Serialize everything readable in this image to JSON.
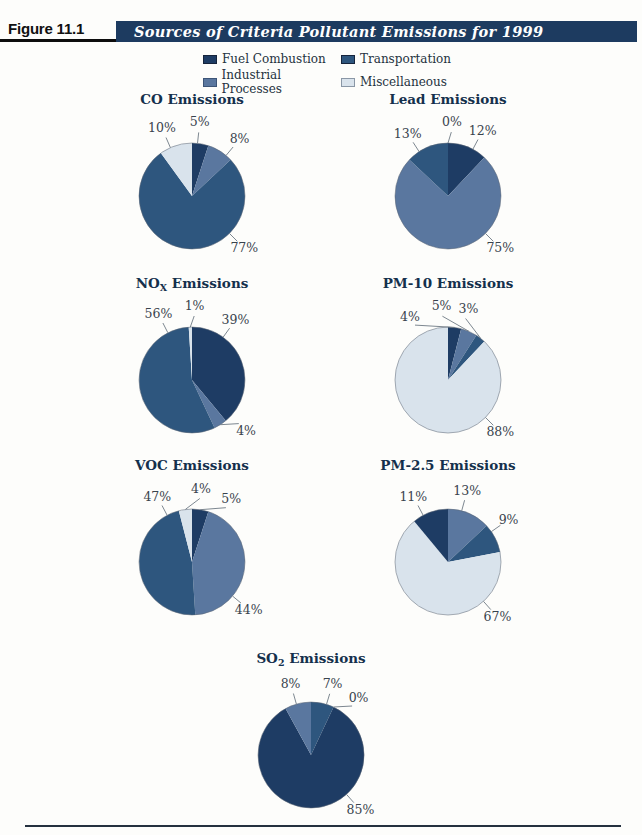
{
  "header": {
    "figure_label": "Figure 11.1",
    "title": "Sources of Criteria Pollutant Emissions for 1999",
    "bar_color": "#1d3b60",
    "text_color": "#ffffff"
  },
  "legend": {
    "items": [
      {
        "label": "Fuel Combustion",
        "color": "#1e3c64",
        "border": "#16243c"
      },
      {
        "label": "Transportation",
        "color": "#2e567e",
        "border": "#16243c"
      },
      {
        "label": "Industrial Processes",
        "color": "#5a779f",
        "border": "#3d5577"
      },
      {
        "label": "Miscellaneous",
        "color": "#d9e3ec",
        "border": "#8a97a6"
      }
    ]
  },
  "chart_data": [
    {
      "type": "pie",
      "start_angle": 0,
      "direction": "clockwise",
      "title": {
        "prefix": "CO",
        "sub": "",
        "suffix": " Emissions"
      },
      "slices": [
        {
          "category": "Fuel Combustion",
          "value": 5,
          "label": "5%",
          "label_angle": 6
        },
        {
          "category": "Industrial Processes",
          "value": 8,
          "label": "8%",
          "label_angle": 40
        },
        {
          "category": "Transportation",
          "value": 77,
          "label": "77%",
          "label_angle": 135
        },
        {
          "category": "Miscellaneous",
          "value": 10,
          "label": "10%",
          "label_angle": -24
        }
      ]
    },
    {
      "type": "pie",
      "start_angle": 0,
      "direction": "clockwise",
      "title": {
        "prefix": "Lead",
        "sub": "",
        "suffix": " Emissions"
      },
      "slices": [
        {
          "category": "Fuel Combustion",
          "value": 12,
          "label": "12%",
          "label_angle": 28
        },
        {
          "category": "Industrial Processes",
          "value": 75,
          "label": "75%",
          "label_angle": 135
        },
        {
          "category": "Transportation",
          "value": 13,
          "label": "13%",
          "label_angle": -33
        },
        {
          "category": "Miscellaneous",
          "value": 0,
          "label": "0%",
          "label_angle": 3
        }
      ]
    },
    {
      "type": "pie",
      "start_angle": 0,
      "direction": "clockwise",
      "title": {
        "prefix": "NO",
        "sub": "X",
        "suffix": " Emissions"
      },
      "slices": [
        {
          "category": "Fuel Combustion",
          "value": 39,
          "label": "39%",
          "label_angle": 36
        },
        {
          "category": "Industrial Processes",
          "value": 4,
          "label": "4%",
          "label_angle": 133
        },
        {
          "category": "Transportation",
          "value": 56,
          "label": "56%",
          "label_angle": -27
        },
        {
          "category": "Miscellaneous",
          "value": 1,
          "label": "1%",
          "label_angle": 2
        }
      ]
    },
    {
      "type": "pie",
      "start_angle": 0,
      "direction": "clockwise",
      "title": {
        "prefix": "PM-10",
        "sub": "",
        "suffix": " Emissions"
      },
      "slices": [
        {
          "category": "Fuel Combustion",
          "value": 4,
          "label": "4%",
          "label_angle": -31
        },
        {
          "category": "Industrial Processes",
          "value": 5,
          "label": "5%",
          "label_angle": -5
        },
        {
          "category": "Transportation",
          "value": 3,
          "label": "3%",
          "label_angle": 16
        },
        {
          "category": "Miscellaneous",
          "value": 88,
          "label": "88%",
          "label_angle": 135
        }
      ]
    },
    {
      "type": "pie",
      "start_angle": 0,
      "direction": "clockwise",
      "title": {
        "prefix": "VOC",
        "sub": "",
        "suffix": " Emissions"
      },
      "slices": [
        {
          "category": "Fuel Combustion",
          "value": 5,
          "label": "5%",
          "label_angle": 32
        },
        {
          "category": "Industrial Processes",
          "value": 44,
          "label": "44%",
          "label_angle": 130
        },
        {
          "category": "Transportation",
          "value": 47,
          "label": "47%",
          "label_angle": -28
        },
        {
          "category": "Miscellaneous",
          "value": 4,
          "label": "4%",
          "label_angle": 7
        }
      ]
    },
    {
      "type": "pie",
      "start_angle": 0,
      "direction": "clockwise",
      "title": {
        "prefix": "PM-2.5",
        "sub": "",
        "suffix": " Emissions"
      },
      "slices": [
        {
          "category": "Industrial Processes",
          "value": 13,
          "label": "13%",
          "label_angle": 15
        },
        {
          "category": "Transportation",
          "value": 9,
          "label": "9%",
          "label_angle": 55
        },
        {
          "category": "Miscellaneous",
          "value": 67,
          "label": "67%",
          "label_angle": 138
        },
        {
          "category": "Fuel Combustion",
          "value": 11,
          "label": "11%",
          "label_angle": -28
        }
      ]
    },
    {
      "type": "pie",
      "start_angle": 0,
      "direction": "clockwise",
      "title": {
        "prefix": "SO",
        "sub": "2",
        "suffix": " Emissions"
      },
      "slices": [
        {
          "category": "Transportation",
          "value": 7,
          "label": "7%",
          "label_angle": 17
        },
        {
          "category": "Miscellaneous",
          "value": 0,
          "label": "0%",
          "label_angle": 40
        },
        {
          "category": "Fuel Combustion",
          "value": 85,
          "label": "85%",
          "label_angle": 138
        },
        {
          "category": "Industrial Processes",
          "value": 8,
          "label": "8%",
          "label_angle": -16
        }
      ]
    }
  ]
}
